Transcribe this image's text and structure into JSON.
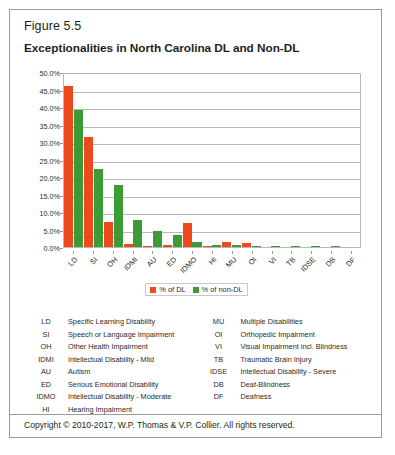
{
  "figure": {
    "label": "Figure 5.5",
    "title": "Exceptionalities in North Carolina DL and Non-DL"
  },
  "colors": {
    "dl": "#ec4a1d",
    "non_dl": "#3d9b35",
    "grid": "#b9b9b9",
    "border": "#9a9a9a"
  },
  "chart_data": {
    "type": "bar",
    "title": "Exceptionalities in North Carolina DL and Non-DL",
    "xlabel": "",
    "ylabel": "",
    "ylim": [
      0,
      50
    ],
    "yticks": [
      "0.0%",
      "5.0%",
      "10.0%",
      "15.0%",
      "20.0%",
      "25.0%",
      "30.0%",
      "35.0%",
      "40.0%",
      "45.0%",
      "50.0%"
    ],
    "ytick_values": [
      0,
      5,
      10,
      15,
      20,
      25,
      30,
      35,
      40,
      45,
      50
    ],
    "grid": true,
    "legend_position": "bottom",
    "categories": [
      "LD",
      "SI",
      "OH",
      "IDMI",
      "AU",
      "ED",
      "IDMO",
      "HI",
      "MU",
      "OI",
      "VI",
      "TB",
      "IDSE",
      "DB",
      "DF"
    ],
    "series": [
      {
        "name": "% of DL",
        "color": "#ec4a1d",
        "values": [
          46.1,
          31.5,
          7.1,
          0.9,
          0.2,
          0.7,
          6.8,
          0.2,
          1.3,
          1.1,
          0.1,
          0.1,
          0.1,
          0.1,
          0.0
        ]
      },
      {
        "name": "% of non-DL",
        "color": "#3d9b35",
        "values": [
          39.1,
          22.3,
          17.8,
          7.8,
          4.7,
          3.3,
          1.3,
          0.5,
          0.6,
          0.4,
          0.2,
          0.2,
          0.2,
          0.2,
          0.1
        ]
      }
    ]
  },
  "legend": {
    "items": [
      {
        "label": "% of DL",
        "color": "#ec4a1d"
      },
      {
        "label": "% of non-DL",
        "color": "#3d9b35"
      }
    ]
  },
  "abbreviations": {
    "left": [
      {
        "key": "LD",
        "value": "Specific Learning Disability"
      },
      {
        "key": "SI",
        "value": "Speech or Language Impairment"
      },
      {
        "key": "OH",
        "value": "Other Health Impairment"
      },
      {
        "key": "IDMI",
        "value": "Intellectual Disability - Mild"
      },
      {
        "key": "AU",
        "value": "Autism"
      },
      {
        "key": "ED",
        "value": "Serious Emotional Disability"
      },
      {
        "key": "IDMO",
        "value": "Intellectual Disability - Moderate"
      },
      {
        "key": "HI",
        "value": "Hearing Impairment"
      }
    ],
    "right": [
      {
        "key": "MU",
        "value": "Multiple Disabilities"
      },
      {
        "key": "OI",
        "value": "Orthopedic Impairment"
      },
      {
        "key": "VI",
        "value": "Visual Impairment incl. Blindness"
      },
      {
        "key": "TB",
        "value": "Traumatic Brain Injury"
      },
      {
        "key": "IDSE",
        "value": "Intellectual Disability - Severe"
      },
      {
        "key": "DB",
        "value": "Deaf-Blindness"
      },
      {
        "key": "DF",
        "value": "Deafness"
      }
    ]
  },
  "footer": {
    "copyright": "Copyright © 2010-2017, W.P. Thomas & V.P. Collier. All rights reserved."
  }
}
